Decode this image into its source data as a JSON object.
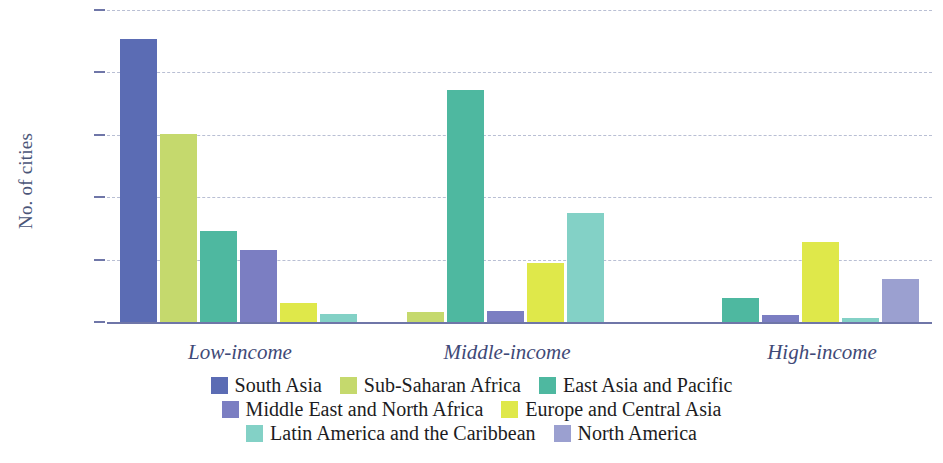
{
  "chart_data": {
    "type": "bar",
    "title": "",
    "subtitle": "",
    "xlabel": "",
    "ylabel": "No. of cities",
    "ylim": [
      0,
      2500
    ],
    "yticks": [
      0,
      500,
      1000,
      1500,
      2000,
      2500
    ],
    "ytick_labels": [
      "0",
      "500",
      "1,000",
      "1,500",
      "2,000",
      "2,500"
    ],
    "grid": true,
    "legend_position": "bottom",
    "categories": [
      "Low-income",
      "Middle-income",
      "High-income"
    ],
    "series": [
      {
        "name": "South Asia",
        "color": "#5b6cb4",
        "values": [
          2270,
          0,
          0
        ]
      },
      {
        "name": "Sub-Saharan Africa",
        "color": "#c5d96d",
        "values": [
          1510,
          80,
          0
        ]
      },
      {
        "name": "East Asia and Pacific",
        "color": "#4eb8a0",
        "values": [
          730,
          1860,
          190
        ]
      },
      {
        "name": "Middle East and North Africa",
        "color": "#7b7ec2",
        "values": [
          580,
          90,
          60
        ]
      },
      {
        "name": "Europe and Central Asia",
        "color": "#dfe84a",
        "values": [
          150,
          470,
          645
        ]
      },
      {
        "name": "Latin America and the Caribbean",
        "color": "#83d1c6",
        "values": [
          65,
          877,
          35
        ]
      },
      {
        "name": "North America",
        "color": "#9ba0d0",
        "values": [
          0,
          0,
          345
        ]
      }
    ],
    "legend_rows": [
      [
        "South Asia",
        "Sub-Saharan Africa",
        "East Asia and Pacific"
      ],
      [
        "Middle East and North Africa",
        "Europe and Central Asia"
      ],
      [
        "Latin America and the Caribbean",
        "North America"
      ]
    ],
    "colors": {
      "south_asia": "#5b6cb4",
      "sub_saharan_africa": "#c5d96d",
      "east_asia_and_pacific": "#4eb8a0",
      "middle_east_and_north_africa": "#7b7ec2",
      "europe_and_central_asia": "#dfe84a",
      "latin_america_and_the_caribbean": "#83d1c6",
      "north_america": "#9ba0d0",
      "axis_text": "#4a5578",
      "gridline": "#b9bfd4",
      "baseline": "#6f76a8"
    }
  }
}
